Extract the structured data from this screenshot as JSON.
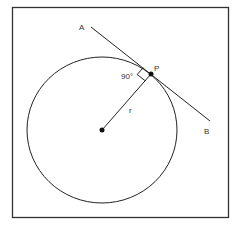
{
  "diagram": {
    "labels": {
      "point_a": "A",
      "point_b": "B",
      "point_p": "P",
      "radius": "r",
      "angle": "90°"
    },
    "colors": {
      "stroke": "#222222",
      "frame": "#333333",
      "background": "#ffffff"
    },
    "geometry": {
      "frame": {
        "x": 12,
        "y": 7,
        "width": 216,
        "height": 210
      },
      "circle": {
        "cx": 102,
        "cy": 130,
        "rx": 75,
        "ry": 73
      },
      "center": {
        "x": 102,
        "y": 130
      },
      "point_p": {
        "x": 151,
        "y": 74
      },
      "tangent_start": {
        "x": 91,
        "y": 27
      },
      "tangent_end": {
        "x": 210,
        "y": 121
      }
    }
  }
}
